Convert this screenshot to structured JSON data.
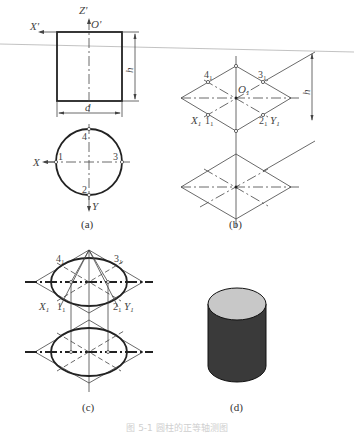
{
  "figure": {
    "panels": [
      {
        "id": "a",
        "caption": "(a)",
        "front_view": {
          "axis_labels": {
            "x": "X'",
            "z": "Z'",
            "origin": "O'"
          },
          "dimensions": {
            "height": "h",
            "diameter": "d"
          }
        },
        "top_view": {
          "axis_labels": {
            "x": "X",
            "y": "Y"
          },
          "points": [
            "1",
            "2",
            "3",
            "4"
          ]
        }
      },
      {
        "id": "b",
        "caption": "(b)",
        "axis_labels": {
          "x": "X",
          "y": "Y",
          "origin": "O",
          "subscript": "1"
        },
        "points": [
          "1",
          "2",
          "3",
          "4"
        ],
        "dimensions": {
          "height": "h"
        }
      },
      {
        "id": "c",
        "caption": "(c)",
        "axis_labels": {
          "x": "X",
          "y": "Y",
          "subscript": "1"
        },
        "points": [
          "1",
          "2",
          "3",
          "4"
        ]
      },
      {
        "id": "d",
        "caption": "(d)",
        "colors": {
          "top_face": "#c8c8c8",
          "side_face": "#3a3a3a",
          "outline": "#111111"
        }
      }
    ],
    "caption": "图 5-1  圆柱的正等轴测图"
  }
}
